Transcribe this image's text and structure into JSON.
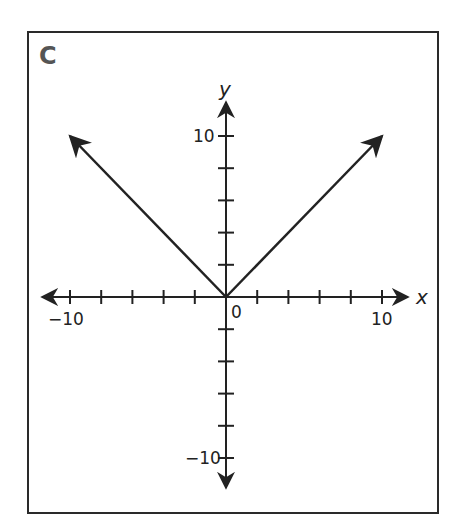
{
  "panel": {
    "label": "C"
  },
  "chart_data": {
    "type": "line",
    "title": "",
    "function": "y = |x|",
    "xlabel": "x",
    "ylabel": "y",
    "xlim": [
      -10,
      10
    ],
    "ylim": [
      -10,
      10
    ],
    "tick_step": 2,
    "x_tick_labels": [
      "-10",
      "0",
      "10"
    ],
    "y_tick_labels": [
      "10",
      "-10"
    ],
    "origin_label": "0",
    "grid": false,
    "series": [
      {
        "name": "left ray",
        "x": [
          0,
          -10
        ],
        "y": [
          0,
          10
        ],
        "arrow_end": true
      },
      {
        "name": "right ray",
        "x": [
          0,
          10
        ],
        "y": [
          0,
          10
        ],
        "arrow_end": true
      }
    ],
    "line_color": "#222222"
  },
  "labels": {
    "x_axis": "x",
    "y_axis": "y",
    "x_neg10": "−10",
    "x_pos10": "10",
    "origin": "0",
    "y_pos10": "10",
    "y_neg10": "−10"
  }
}
